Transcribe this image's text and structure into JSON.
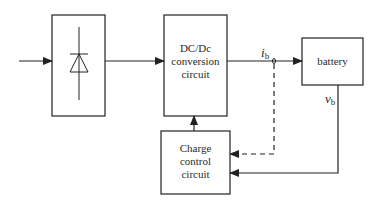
{
  "diagram": {
    "blocks": {
      "rectifier": {
        "icon": "diode-icon"
      },
      "dcdc": {
        "line1": "DC/Dc",
        "line2": "conversion",
        "line3": "circuit"
      },
      "battery": {
        "label": "battery"
      },
      "charge_control": {
        "line1": "Charge",
        "line2": "control",
        "line3": "circuit"
      }
    },
    "signals": {
      "current": {
        "symbol": "i",
        "subscript": "b"
      },
      "voltage": {
        "symbol": "v",
        "subscript": "b"
      }
    },
    "colors": {
      "line": "#222222",
      "background": "#ffffff"
    }
  }
}
